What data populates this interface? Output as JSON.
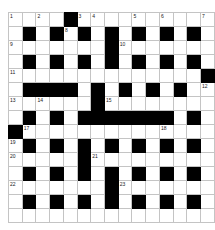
{
  "header": {
    "text": ""
  },
  "grid": {
    "columns": 15,
    "rows": 15,
    "cell_size_px": 13,
    "colors": {
      "block": "#000000",
      "cell": "#ffffff",
      "gridline": "#c4c4c4",
      "number": "#1a1a1a"
    },
    "legend": {
      "0": "white-cell",
      "1": "black-block"
    },
    "cells": [
      [
        0,
        0,
        0,
        0,
        1,
        0,
        0,
        0,
        0,
        0,
        0,
        0,
        0,
        0,
        0
      ],
      [
        0,
        1,
        0,
        1,
        0,
        1,
        0,
        1,
        0,
        1,
        0,
        1,
        0,
        1,
        0
      ],
      [
        0,
        0,
        0,
        0,
        0,
        0,
        0,
        1,
        0,
        0,
        0,
        0,
        0,
        0,
        0
      ],
      [
        0,
        1,
        0,
        1,
        0,
        1,
        0,
        1,
        0,
        1,
        0,
        1,
        0,
        1,
        0
      ],
      [
        0,
        0,
        0,
        0,
        0,
        0,
        0,
        0,
        0,
        0,
        0,
        0,
        0,
        0,
        1
      ],
      [
        0,
        1,
        1,
        1,
        1,
        0,
        1,
        0,
        1,
        0,
        1,
        0,
        1,
        0,
        0
      ],
      [
        0,
        0,
        0,
        0,
        0,
        0,
        1,
        0,
        0,
        0,
        0,
        0,
        0,
        0,
        0
      ],
      [
        0,
        1,
        0,
        1,
        0,
        1,
        1,
        1,
        1,
        1,
        1,
        1,
        0,
        1,
        0
      ],
      [
        1,
        0,
        0,
        0,
        0,
        0,
        0,
        0,
        0,
        0,
        0,
        0,
        0,
        0,
        0
      ],
      [
        0,
        1,
        0,
        1,
        0,
        1,
        0,
        1,
        0,
        1,
        0,
        1,
        0,
        1,
        0
      ],
      [
        0,
        0,
        0,
        0,
        0,
        1,
        0,
        0,
        0,
        0,
        0,
        0,
        0,
        0,
        0
      ],
      [
        0,
        1,
        0,
        1,
        0,
        1,
        0,
        1,
        0,
        1,
        0,
        1,
        0,
        1,
        0
      ],
      [
        0,
        0,
        0,
        0,
        0,
        0,
        0,
        1,
        0,
        0,
        0,
        0,
        0,
        0,
        0
      ],
      [
        0,
        1,
        0,
        1,
        0,
        1,
        0,
        1,
        0,
        1,
        0,
        1,
        0,
        1,
        0
      ],
      [
        0,
        0,
        0,
        0,
        0,
        0,
        0,
        0,
        0,
        0,
        0,
        0,
        0,
        0,
        0
      ]
    ],
    "numbers": [
      {
        "row": 0,
        "col": 0,
        "label": "1"
      },
      {
        "row": 0,
        "col": 2,
        "label": "2"
      },
      {
        "row": 0,
        "col": 5,
        "label": "3"
      },
      {
        "row": 0,
        "col": 6,
        "label": "4"
      },
      {
        "row": 0,
        "col": 9,
        "label": "5"
      },
      {
        "row": 0,
        "col": 11,
        "label": "6"
      },
      {
        "row": 0,
        "col": 14,
        "label": "7"
      },
      {
        "row": 1,
        "col": 4,
        "label": "8"
      },
      {
        "row": 2,
        "col": 0,
        "label": "9"
      },
      {
        "row": 2,
        "col": 8,
        "label": "10"
      },
      {
        "row": 4,
        "col": 0,
        "label": "11"
      },
      {
        "row": 5,
        "col": 14,
        "label": "12"
      },
      {
        "row": 6,
        "col": 0,
        "label": "13"
      },
      {
        "row": 6,
        "col": 2,
        "label": "14"
      },
      {
        "row": 6,
        "col": 7,
        "label": "15"
      },
      {
        "row": 7,
        "col": 5,
        "label": "16"
      },
      {
        "row": 8,
        "col": 1,
        "label": "17"
      },
      {
        "row": 8,
        "col": 11,
        "label": "18"
      },
      {
        "row": 9,
        "col": 0,
        "label": "19"
      },
      {
        "row": 10,
        "col": 0,
        "label": "20"
      },
      {
        "row": 10,
        "col": 6,
        "label": "21"
      },
      {
        "row": 12,
        "col": 0,
        "label": "22"
      },
      {
        "row": 12,
        "col": 8,
        "label": "23"
      }
    ]
  }
}
